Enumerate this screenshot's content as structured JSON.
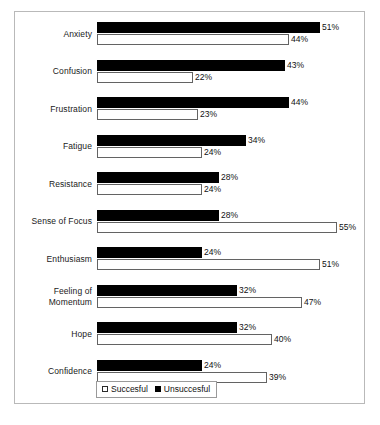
{
  "chart_data": {
    "type": "bar",
    "orientation": "horizontal",
    "title": "",
    "subtitle": "",
    "xlabel": "",
    "ylabel": "",
    "xlim": [
      0,
      60
    ],
    "grid": false,
    "legend_position": "bottom",
    "value_suffix": "%",
    "categories": [
      "Anxiety",
      "Confusion",
      "Frustration",
      "Fatigue",
      "Resistance",
      "Sense of Focus",
      "Enthusiasm",
      "Feeling of\nMomentum",
      "Hope",
      "Confidence"
    ],
    "series": [
      {
        "name": "Unsuccesful",
        "color": "#000000",
        "values": [
          51,
          43,
          44,
          34,
          28,
          28,
          24,
          32,
          32,
          24
        ],
        "labels": [
          "51%",
          "43%",
          "44%",
          "34%",
          "28%",
          "28%",
          "24%",
          "32%",
          "32%",
          "24%"
        ]
      },
      {
        "name": "Succesful",
        "color": "#ffffff",
        "values": [
          44,
          22,
          23,
          24,
          24,
          55,
          51,
          47,
          40,
          39
        ],
        "labels": [
          "44%",
          "22%",
          "23%",
          "24%",
          "24%",
          "55%",
          "51%",
          "47%",
          "40%",
          "39%"
        ]
      }
    ]
  },
  "legend": {
    "entries": [
      {
        "label": "Succesful",
        "swatch": "open-square-icon"
      },
      {
        "label": "Unsuccesful",
        "swatch": "filled-square-icon"
      }
    ]
  },
  "caption": ""
}
